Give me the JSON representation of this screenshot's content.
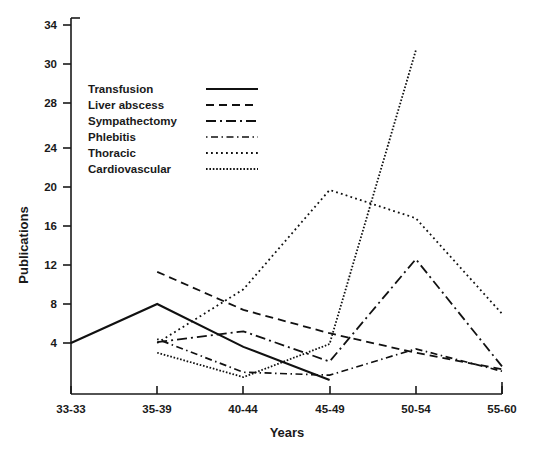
{
  "chart_data": {
    "type": "line",
    "title": "",
    "xlabel": "Years",
    "ylabel": "Publications",
    "categories": [
      "33-33",
      "35-39",
      "40-44",
      "45-49",
      "50-54",
      "55-60"
    ],
    "ytick_labels": [
      "4",
      "8",
      "12",
      "16",
      "20",
      "24",
      "28",
      "30",
      "34"
    ],
    "ytick_values": [
      4,
      8,
      12,
      16,
      20,
      24,
      28,
      30,
      34
    ],
    "ylim": [
      0,
      34
    ],
    "xlim_categories": [
      "33-33",
      "55-60"
    ],
    "grid": false,
    "legend_position": "upper-left-inside",
    "series": [
      {
        "name": "Transfusion",
        "style": "solid",
        "values": [
          4,
          8,
          3.6,
          0.2,
          null,
          null
        ]
      },
      {
        "name": "Liver abscess",
        "style": "dashed",
        "values": [
          null,
          11.3,
          7.4,
          5.0,
          3.0,
          1.3
        ]
      },
      {
        "name": "Sympathectomy",
        "style": "dash-dot-long",
        "values": [
          null,
          4.1,
          5.2,
          2.1,
          12.6,
          1.6
        ]
      },
      {
        "name": "Phlebitis",
        "style": "dash-dot-fine",
        "values": [
          null,
          4.4,
          1.0,
          0.7,
          3.4,
          1.1
        ]
      },
      {
        "name": "Thoracic",
        "style": "dotted-medium",
        "values": [
          null,
          4.0,
          9.5,
          19.7,
          16.8,
          7.0
        ]
      },
      {
        "name": "Cardiovascular",
        "style": "dotted-fine",
        "values": [
          null,
          3.0,
          0.5,
          3.9,
          34.0,
          null
        ]
      }
    ]
  },
  "legend": {
    "items": [
      {
        "label": "Transfusion"
      },
      {
        "label": "Liver abscess"
      },
      {
        "label": "Sympathectomy"
      },
      {
        "label": "Phlebitis"
      },
      {
        "label": "Thoracic"
      },
      {
        "label": "Cardiovascular"
      }
    ]
  },
  "axes": {
    "y_title": "Publications",
    "x_title": "Years",
    "y_ticks": [
      "34",
      "30",
      "28",
      "24",
      "20",
      "16",
      "12",
      "8",
      "4"
    ],
    "x_ticks": [
      "33-33",
      "35-39",
      "40-44",
      "45-49",
      "50-54",
      "55-60"
    ]
  },
  "colors": {
    "ink": "#111111",
    "background": "#ffffff"
  }
}
